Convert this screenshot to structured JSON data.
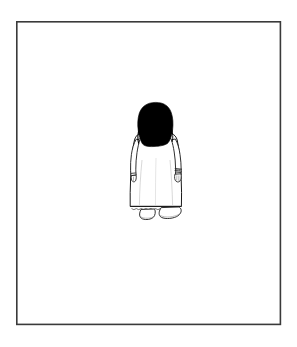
{
  "scene": {
    "title": "Line drawing of a standing figure seen from behind",
    "canvas_width": 297,
    "canvas_height": 347,
    "background_color": "#ffffff",
    "caption": ""
  },
  "frame": {
    "name": "picture-frame-border",
    "x": 16,
    "y": 21,
    "width": 265,
    "height": 304,
    "stroke_color": "#3a3a3a",
    "stroke_width": 1.6,
    "fill_color": "#ffffff"
  },
  "figure": {
    "name": "person-from-behind",
    "ink_color": "#1a1a1a",
    "fill_color": "#ffffff",
    "line_width": 1.0,
    "bounds": {
      "x": 127,
      "y": 102,
      "width": 57,
      "height": 125
    },
    "parts": [
      {
        "name": "hair",
        "label": "Hair",
        "color": "#000000",
        "shape": "solid-black-rounded-mass",
        "bounds": {
          "x": 138,
          "y": 102,
          "width": 35,
          "height": 44
        }
      },
      {
        "name": "dress",
        "label": "Dress",
        "color": "#ffffff",
        "shape": "a-line-gown",
        "bounds": {
          "x": 131,
          "y": 133,
          "width": 50,
          "height": 76
        }
      },
      {
        "name": "left-arm",
        "label": "Left arm",
        "bounds": {
          "x": 129,
          "y": 140,
          "width": 12,
          "height": 36
        }
      },
      {
        "name": "right-arm",
        "label": "Right arm",
        "bounds": {
          "x": 168,
          "y": 140,
          "width": 14,
          "height": 36
        }
      },
      {
        "name": "left-hand",
        "label": "Left hand",
        "bounds": {
          "x": 130,
          "y": 172,
          "width": 7,
          "height": 9
        }
      },
      {
        "name": "right-hand",
        "label": "Right hand",
        "bounds": {
          "x": 172,
          "y": 170,
          "width": 9,
          "height": 11
        }
      },
      {
        "name": "bracelet",
        "label": "Bracelet on right wrist",
        "bounds": {
          "x": 172,
          "y": 168,
          "width": 10,
          "height": 6
        }
      },
      {
        "name": "hem-scallop",
        "label": "Scalloped dress hem",
        "bounds": {
          "x": 131,
          "y": 205,
          "width": 50,
          "height": 5
        }
      },
      {
        "name": "left-shoe",
        "label": "Left shoe",
        "bounds": {
          "x": 140,
          "y": 209,
          "width": 16,
          "height": 10
        }
      },
      {
        "name": "right-shoe",
        "label": "Right shoe",
        "bounds": {
          "x": 160,
          "y": 207,
          "width": 21,
          "height": 11
        }
      }
    ]
  }
}
